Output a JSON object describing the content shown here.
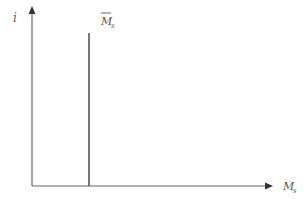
{
  "diagram": {
    "type": "money-supply-curve",
    "y_axis_label": "i",
    "x_axis_label": "M",
    "x_axis_label_sub": "s",
    "curve_label": "M",
    "curve_label_sub": "s",
    "curve_label_bar": true,
    "colors": {
      "axis": "#666666",
      "curve": "#555555",
      "text": "#555555"
    }
  }
}
